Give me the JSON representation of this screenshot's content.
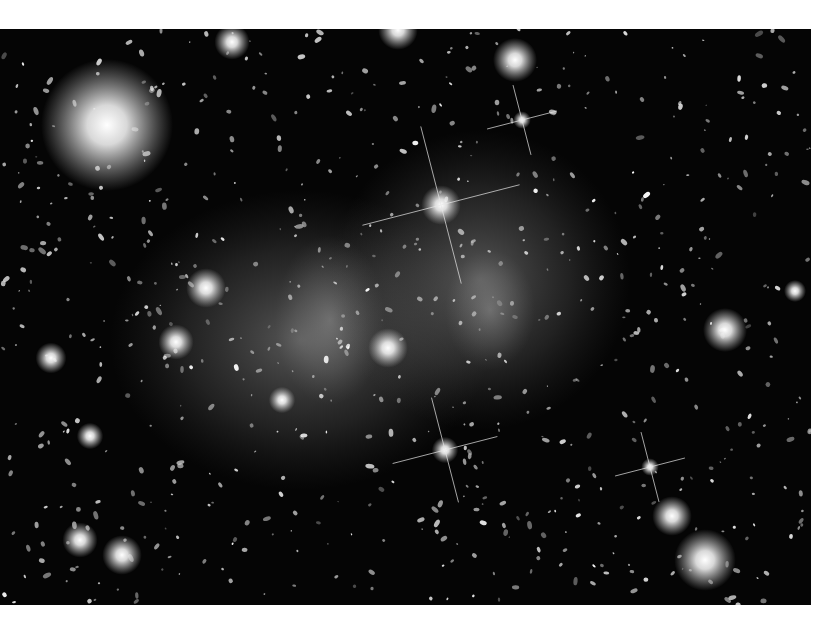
{
  "image": {
    "subject": "galaxy cluster with diffuse intracluster light",
    "background": "#050505",
    "glow_color": "#9a9a9a",
    "bright_stars": [
      {
        "x": 441,
        "y": 205,
        "r": 9,
        "spikes": true
      },
      {
        "x": 445,
        "y": 450,
        "r": 6,
        "spikes": true
      },
      {
        "x": 522,
        "y": 120,
        "r": 4,
        "spikes": true
      },
      {
        "x": 650,
        "y": 467,
        "r": 4,
        "spikes": true
      },
      {
        "x": 107,
        "y": 125,
        "r": 30,
        "spikes": false
      },
      {
        "x": 515,
        "y": 60,
        "r": 10,
        "spikes": false
      },
      {
        "x": 725,
        "y": 330,
        "r": 10,
        "spikes": false
      },
      {
        "x": 705,
        "y": 560,
        "r": 14,
        "spikes": false
      },
      {
        "x": 672,
        "y": 516,
        "r": 9,
        "spikes": false
      },
      {
        "x": 388,
        "y": 348,
        "r": 9,
        "spikes": false
      },
      {
        "x": 206,
        "y": 288,
        "r": 9,
        "spikes": false
      },
      {
        "x": 176,
        "y": 342,
        "r": 8,
        "spikes": false
      },
      {
        "x": 398,
        "y": 30,
        "r": 9,
        "spikes": false
      },
      {
        "x": 232,
        "y": 42,
        "r": 8,
        "spikes": false
      },
      {
        "x": 51,
        "y": 358,
        "r": 7,
        "spikes": false
      },
      {
        "x": 90,
        "y": 436,
        "r": 6,
        "spikes": false
      },
      {
        "x": 80,
        "y": 540,
        "r": 8,
        "spikes": false
      },
      {
        "x": 122,
        "y": 555,
        "r": 9,
        "spikes": false
      },
      {
        "x": 282,
        "y": 400,
        "r": 6,
        "spikes": false
      },
      {
        "x": 795,
        "y": 291,
        "r": 5,
        "spikes": false
      }
    ],
    "glows": [
      {
        "x": 330,
        "y": 320,
        "rx": 55,
        "ry": 85
      },
      {
        "x": 490,
        "y": 310,
        "rx": 45,
        "ry": 60
      },
      {
        "x": 300,
        "y": 340,
        "rx": 190,
        "ry": 150
      },
      {
        "x": 480,
        "y": 280,
        "rx": 150,
        "ry": 150
      }
    ]
  }
}
